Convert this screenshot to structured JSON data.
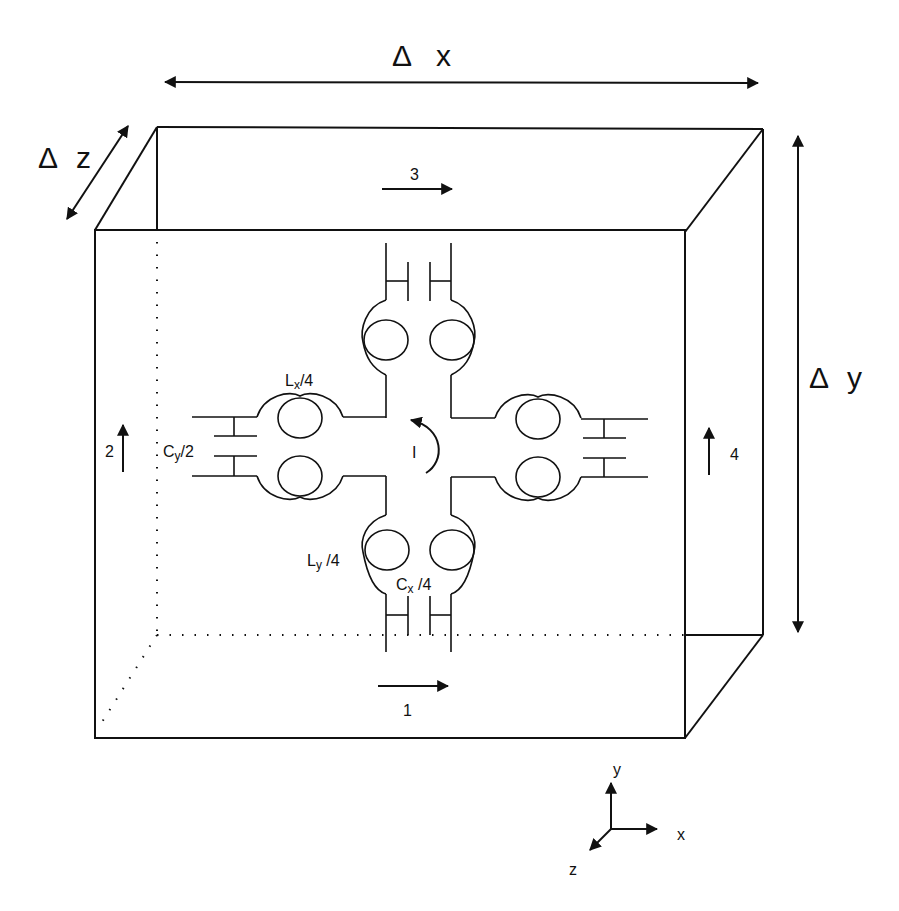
{
  "figure": {
    "dimension_labels": {
      "dx": {
        "symbol": "Δ",
        "axis": "x"
      },
      "dy": {
        "symbol": "Δ",
        "axis": "y"
      },
      "dz": {
        "symbol": "Δ",
        "axis": "z"
      }
    },
    "current_arrows": [
      {
        "id": "1",
        "label": "1",
        "direction": "right",
        "position": "bottom"
      },
      {
        "id": "2",
        "label": "2",
        "direction": "up",
        "position": "left"
      },
      {
        "id": "3",
        "label": "3",
        "direction": "right",
        "position": "top"
      },
      {
        "id": "4",
        "label": "4",
        "direction": "up",
        "position": "right"
      }
    ],
    "circuit_labels": {
      "lx": {
        "main": "L",
        "sub": "x",
        "suffix": "/4"
      },
      "ly": {
        "main": "L",
        "sub": "y",
        "suffix": " /4"
      },
      "cx": {
        "main": "C",
        "sub": "x",
        "suffix": " /4"
      },
      "cy": {
        "main": "C",
        "sub": "y",
        "suffix": "/2"
      },
      "current": "I"
    },
    "axes": {
      "x": "x",
      "y": "y",
      "z": "z"
    },
    "colors": {
      "stroke": "#111111",
      "background": "#ffffff"
    }
  }
}
